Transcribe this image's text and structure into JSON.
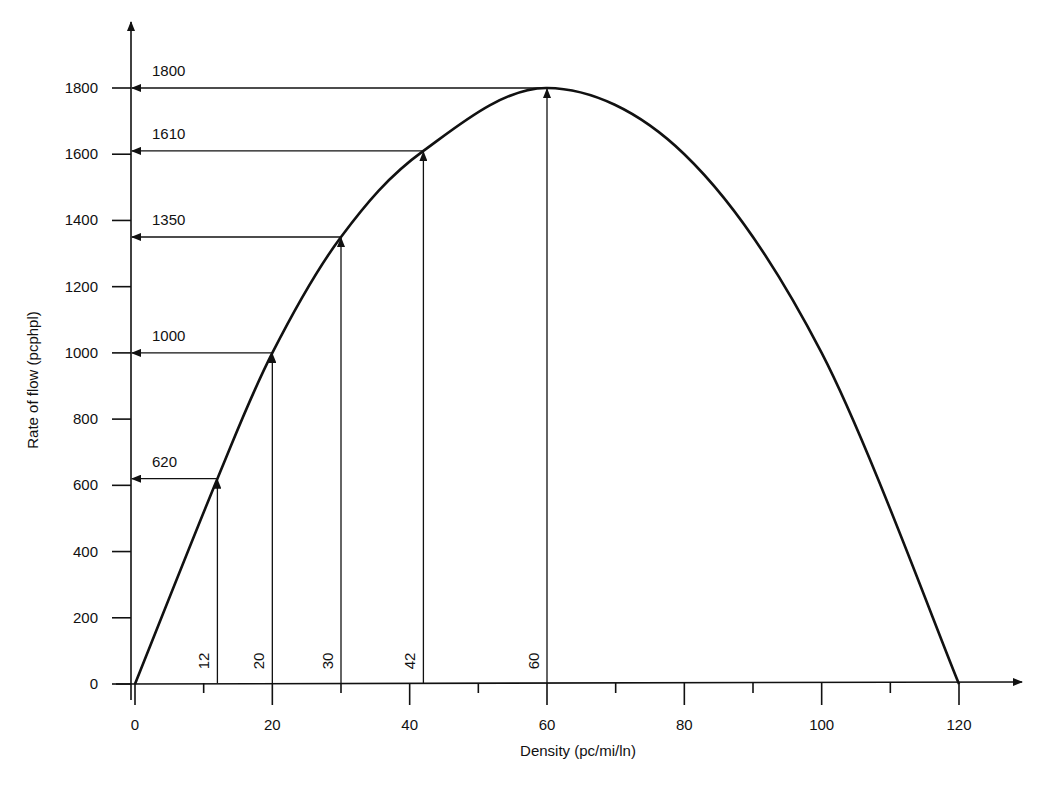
{
  "chart_data": {
    "type": "line",
    "title": "",
    "xlabel": "Density (pc/mi/ln)",
    "ylabel": "Rate of flow (pcphpl)",
    "xlim": [
      0,
      120
    ],
    "ylim": [
      0,
      1800
    ],
    "grid": false,
    "legend": null,
    "x_ticks_major": [
      0,
      20,
      40,
      60,
      80,
      100,
      120
    ],
    "x_ticks_minor": [
      10,
      30,
      50,
      70,
      90,
      110
    ],
    "y_ticks": [
      0,
      200,
      400,
      600,
      800,
      1000,
      1200,
      1400,
      1600,
      1800
    ],
    "series": [
      {
        "name": "flow-density curve",
        "x": [
          0,
          12,
          20,
          30,
          42,
          60,
          80,
          100,
          120
        ],
        "y": [
          0,
          620,
          1000,
          1350,
          1610,
          1800,
          1600,
          1000,
          0
        ]
      }
    ],
    "annotations": [
      {
        "density": 12,
        "flow": 620
      },
      {
        "density": 20,
        "flow": 1000
      },
      {
        "density": 30,
        "flow": 1350
      },
      {
        "density": 42,
        "flow": 1610
      },
      {
        "density": 60,
        "flow": 1800
      }
    ]
  },
  "labels": {
    "x_axis_title": "Density (pc/mi/ln)",
    "y_axis_title": "Rate of flow (pcphpl)",
    "x_ticks": [
      "0",
      "20",
      "40",
      "60",
      "80",
      "100",
      "120"
    ],
    "y_ticks": [
      "0",
      "200",
      "400",
      "600",
      "800",
      "1000",
      "1200",
      "1400",
      "1600",
      "1800"
    ],
    "flow_annotations": [
      "620",
      "1000",
      "1350",
      "1610",
      "1800"
    ],
    "density_annotations": [
      "12",
      "20",
      "30",
      "42",
      "60"
    ]
  }
}
